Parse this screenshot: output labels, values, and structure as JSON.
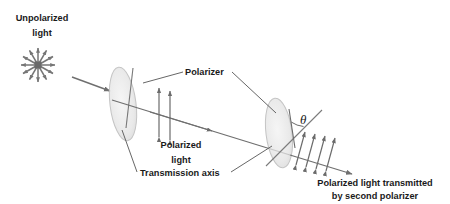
{
  "figure": {
    "background_color": "#ffffff",
    "beam_color": "#7a7a7a",
    "disk_color": "#d8d8d8",
    "label_color": "#1a1a1a",
    "arrow_color": "#6b6b6b",
    "leader_color": "#555555"
  },
  "labels": {
    "unpolarized_line1": "Unpolarized",
    "unpolarized_line2": "light",
    "polarizer": "Polarizer",
    "polarized_line1": "Polarized",
    "polarized_line2": "light",
    "transmission_axis": "Transmission axis",
    "theta": "θ",
    "transmitted_line1": "Polarized light transmitted",
    "transmitted_line2": "by second polarizer"
  },
  "elements": {
    "source_starburst": {
      "name": "unpolarized-light-source",
      "center_x": 38,
      "center_y": 65,
      "ray_count": 12,
      "ray_length": 17,
      "hub_size": 7
    },
    "incident_beam": {
      "name": "incident-beam-arrow",
      "x1": 72,
      "y1": 77,
      "x2": 112,
      "y2": 92
    },
    "first_polarizer": {
      "name": "first-polarizer-disk",
      "cx": 123,
      "cy": 104,
      "rx": 13,
      "ry": 36,
      "rotation": -8
    },
    "second_polarizer": {
      "name": "second-polarizer-disk",
      "cx": 279,
      "cy": 133,
      "rx": 13,
      "ry": 34,
      "rotation": -8
    },
    "main_beam": {
      "name": "main-beam-axis",
      "x1": 112,
      "y1": 101,
      "x2": 345,
      "y2": 172
    },
    "polarized_arrows": {
      "name": "vertical-polarization-arrows",
      "count": 2,
      "orientation": "vertical"
    },
    "transmitted_arrows": {
      "name": "tilted-polarization-arrows",
      "count": 4,
      "orientation": "tilted"
    }
  }
}
